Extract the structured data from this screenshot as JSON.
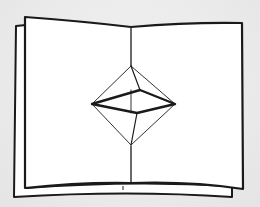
{
  "illustration": {
    "subject": "pop-up book with octahedron",
    "colors": {
      "background": "#ececec",
      "paper": "#ffffff",
      "ink": "#1a1a1a"
    },
    "elements": [
      {
        "name": "back-sheet",
        "description": "paper sheet behind, offset to the lower-left"
      },
      {
        "name": "front-sheet",
        "description": "open book spread"
      },
      {
        "name": "center-fold",
        "description": "vertical gutter fold line"
      },
      {
        "name": "octahedron",
        "description": "pop-up octahedron shape at center"
      }
    ]
  }
}
